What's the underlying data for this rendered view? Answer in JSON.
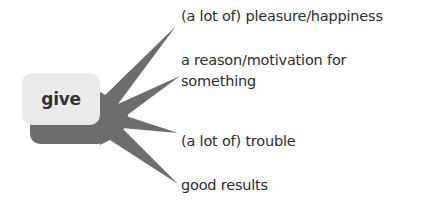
{
  "diagram": {
    "type": "word-collocation-starburst",
    "center": {
      "label": "give"
    },
    "branches": [
      {
        "label": "(a lot of) pleasure/happiness"
      },
      {
        "label": "a reason/motivation for something",
        "line1": "a reason/motivation for",
        "line2": "something"
      },
      {
        "label": "(a lot of) trouble"
      },
      {
        "label": "good results"
      }
    ],
    "colors": {
      "starburst": "#6d6d6d",
      "node_fill": "#ebebeb",
      "node_shadow": "#6d6d6d",
      "text": "#2d2d2d"
    }
  }
}
